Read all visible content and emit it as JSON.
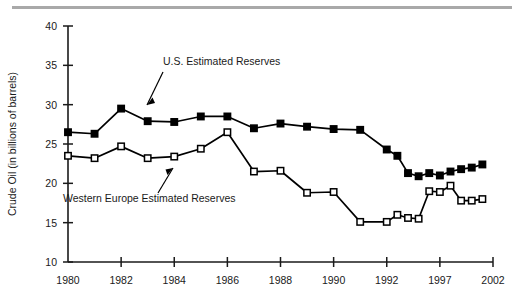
{
  "figure": {
    "top_rule_color": "#a9a9a9",
    "background_color": "#ffffff",
    "line_color": "#000000"
  },
  "axes": {
    "y_title": "Crude Oil (in billions of barrels)",
    "y_ticks": [
      "10",
      "15",
      "20",
      "25",
      "30",
      "35",
      "40"
    ],
    "x_ticks": [
      "1980",
      "1982",
      "1984",
      "1986",
      "1988",
      "1990",
      "1992",
      "1997",
      "2002"
    ]
  },
  "annotations": {
    "us_label": "U.S. Estimated Reserves",
    "we_label": "Western Europe Estimated Reserves"
  },
  "chart_data": {
    "type": "line",
    "title": "",
    "xlabel": "",
    "ylabel": "Crude Oil (in billions of barrels)",
    "ylim": [
      10,
      40
    ],
    "yticks": [
      10,
      15,
      20,
      25,
      30,
      35,
      40
    ],
    "xtick_labels": [
      "1980",
      "1982",
      "1984",
      "1986",
      "1988",
      "1990",
      "1992",
      "1997",
      "2002"
    ],
    "xtick_positions": [
      1980,
      1982,
      1984,
      1986,
      1988,
      1990,
      1992,
      1997,
      2002
    ],
    "x_axis_note": "compressed after 1992: 1992 to 1997 and 1997 to 2002 occupy the same width as two regular years",
    "grid": false,
    "legend": "inline-annotations",
    "x": [
      1980,
      1981,
      1982,
      1983,
      1984,
      1985,
      1986,
      1987,
      1988,
      1989,
      1990,
      1991,
      1992,
      1993,
      1994,
      1995,
      1996,
      1997,
      1998,
      1999,
      2000,
      2001
    ],
    "series": [
      {
        "name": "U.S. Estimated Reserves",
        "marker": "filled-square",
        "values": [
          26.5,
          26.3,
          29.5,
          27.9,
          27.8,
          28.5,
          28.5,
          27.0,
          27.6,
          27.2,
          26.9,
          26.8,
          24.3,
          23.5,
          21.3,
          20.9,
          21.3,
          21.0,
          21.5,
          21.8,
          22.0,
          22.4
        ]
      },
      {
        "name": "Western Europe Estimated Reserves",
        "marker": "open-square",
        "values": [
          23.5,
          23.2,
          24.7,
          23.2,
          23.4,
          24.4,
          26.5,
          21.5,
          21.6,
          18.8,
          18.9,
          15.1,
          15.1,
          16.0,
          15.6,
          15.5,
          19.0,
          18.9,
          19.7,
          17.8,
          17.8,
          18.0
        ]
      }
    ]
  }
}
